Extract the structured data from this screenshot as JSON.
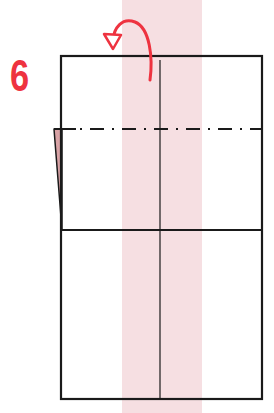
{
  "step": {
    "number": "6",
    "color": "#ee3340"
  },
  "diagram": {
    "paper_color": "#ffffff",
    "line_color": "#1a1a1a",
    "accent_band_color": "#f6dfe2",
    "flap_color": "#c98a8a",
    "fold_line_type": "mountain-fold-dash-dot",
    "arrow_icon": "fold-behind-arrow"
  }
}
